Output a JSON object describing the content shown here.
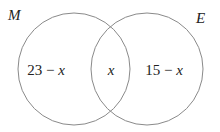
{
  "diagram": {
    "type": "venn",
    "sets": [
      {
        "id": "M",
        "label": "M",
        "circle": {
          "cx": 74,
          "cy": 69,
          "r": 56
        }
      },
      {
        "id": "E",
        "label": "E",
        "circle": {
          "cx": 147,
          "cy": 69,
          "r": 56
        }
      }
    ],
    "regions": {
      "only_M": {
        "number": "23",
        "op": " − ",
        "var": "x"
      },
      "intersection": {
        "var": "x"
      },
      "only_E": {
        "number": "15",
        "op": " − ",
        "var": "x"
      }
    },
    "stroke_color": "#8a8a8a",
    "text_color": "#222222"
  }
}
